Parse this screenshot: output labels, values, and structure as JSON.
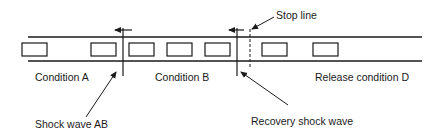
{
  "diagram": {
    "type": "traffic shock wave diagram",
    "road": {
      "top_y": 37,
      "bottom_y": 61,
      "x_start": 28,
      "x_end": 422,
      "color": "#1a1a1a"
    },
    "vehicles": [
      {
        "x": 22
      },
      {
        "x": 91
      },
      {
        "x": 129
      },
      {
        "x": 167
      },
      {
        "x": 205
      },
      {
        "x": 262
      },
      {
        "x": 313
      }
    ],
    "vehicle_size": {
      "width": 25,
      "height": 13,
      "y": 43
    },
    "labels": {
      "condition_a": "Condition A",
      "condition_b": "Condition B",
      "release_condition_d": "Release condition D",
      "shock_wave_ab": "Shock wave AB",
      "recovery_shock_wave": "Recovery shock wave",
      "stop_line": "Stop line"
    },
    "shock_waves": [
      {
        "name": "Shock wave AB",
        "x": 123,
        "direction": "left"
      },
      {
        "name": "Recovery shock wave",
        "x": 237,
        "direction": "left"
      }
    ],
    "stop_line": {
      "x": 250,
      "style": "dashed"
    }
  }
}
